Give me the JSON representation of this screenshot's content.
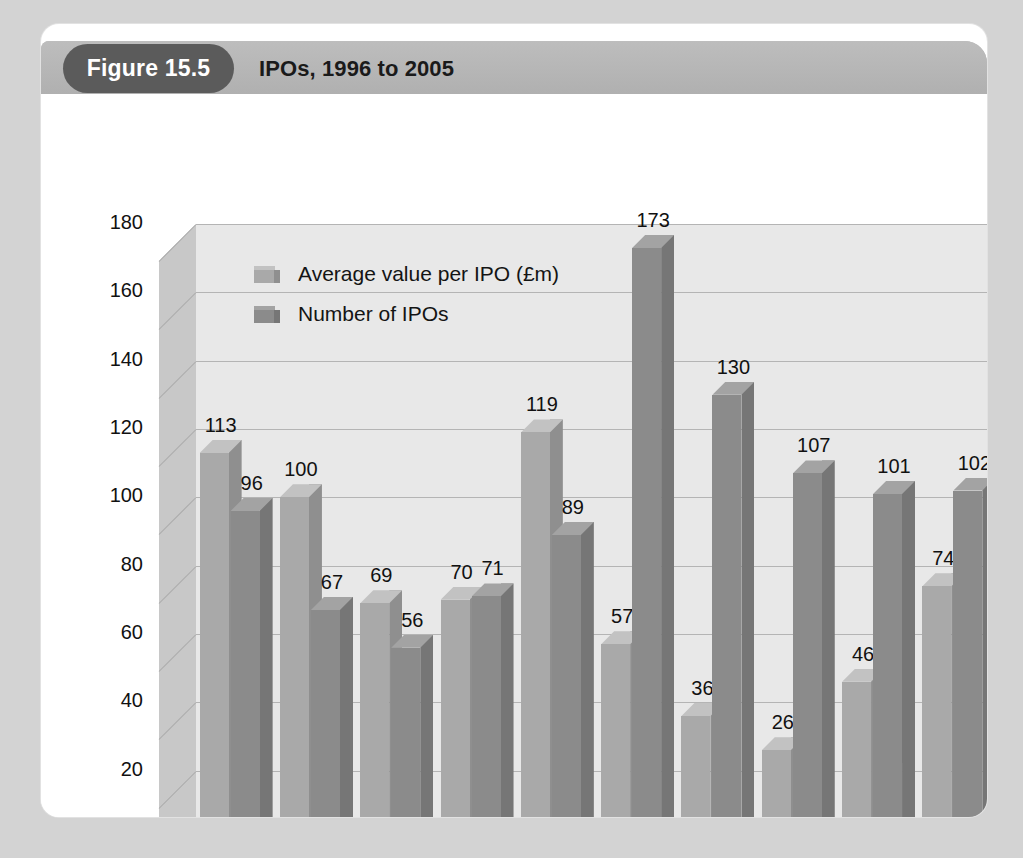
{
  "figure": {
    "pill_label": "Figure 15.5",
    "title": "IPOs, 1996 to 2005"
  },
  "colors": {
    "page_background": "#d3d3d3",
    "card_background": "#ffffff",
    "header_band": "#b5b5b5",
    "pill_background": "#5b5b5b",
    "pill_text": "#ffffff",
    "plot_background": "#e8e8e8",
    "plot_left_wall": "#c8c8c8",
    "plot_floor": "#cdcdcd",
    "gridline": "#b4b4b4",
    "series_light_front": "#a9a9a9",
    "series_light_side": "#8f8f8f",
    "series_light_top": "#c2c2c2",
    "series_dark_front": "#8b8b8b",
    "series_dark_side": "#767676",
    "series_dark_top": "#a3a3a3",
    "text": "#111111"
  },
  "chart_data": {
    "type": "bar",
    "title": "IPOs, 1996 to 2005",
    "xlabel": "",
    "ylabel": "",
    "ylim": [
      0,
      180
    ],
    "ytick_step": 20,
    "yticks": [
      0,
      20,
      40,
      60,
      80,
      100,
      120,
      140,
      160,
      180
    ],
    "grid": true,
    "legend_position": "top-left-inside",
    "three_d": true,
    "categories": [
      "1996",
      "1997",
      "1998",
      "1999",
      "2000",
      "2001",
      "2002",
      "2003",
      "2004",
      "2005"
    ],
    "series": [
      {
        "name": "Average value per IPO (£m)",
        "style": "light",
        "values": [
          113,
          100,
          69,
          70,
          119,
          57,
          36,
          26,
          46,
          74
        ]
      },
      {
        "name": "Number of IPOs",
        "style": "dark",
        "values": [
          96,
          67,
          56,
          71,
          89,
          173,
          130,
          107,
          101,
          102
        ]
      }
    ]
  }
}
